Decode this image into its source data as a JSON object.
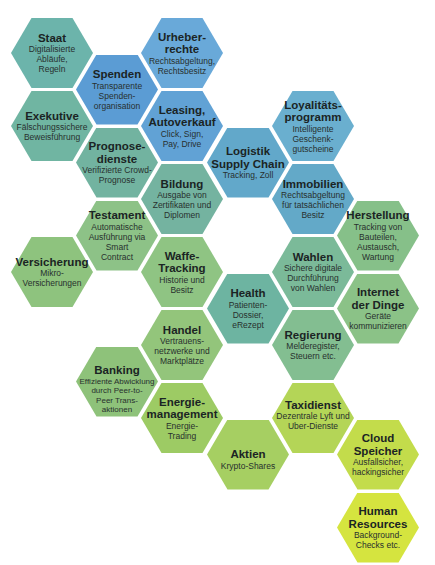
{
  "hexes": [
    {
      "title": "Staat",
      "description": "Digitalisierte\nAbläufe,\nRegeln",
      "color": "#6cb4ab"
    },
    {
      "title": "Exekutive",
      "description": "Fälschungssichere\nBeweisführung",
      "color": "#70b5a2"
    },
    {
      "title": "Versicherung",
      "description": "Mikro-\nVersicherungen",
      "color": "#8ec37e"
    },
    {
      "title": "Spenden",
      "description": "Transparente\nSpenden-\norganisation",
      "color": "#5b9cd4"
    },
    {
      "title": "Prognose-\ndienste",
      "description": "Verifizierte Crowd-\nPrognose",
      "color": "#72b3a0"
    },
    {
      "title": "Testament",
      "description": "Automatische\nAusführung via\nSmart\nContract",
      "color": "#8dc287"
    },
    {
      "title": "Banking",
      "description": "Effiziente Abwicklung\ndurch Peer-to-\nPeer Trans-\naktionen",
      "color": "#8ec27a"
    },
    {
      "title": "Urheber-\nrechte",
      "description": "Rechtsabgeltung,\nRechtsbesitz",
      "color": "#69a9d9"
    },
    {
      "title": "Leasing,\nAutoverkauf",
      "description": "Click, Sign,\nPay, Drive",
      "color": "#61a2d5"
    },
    {
      "title": "Bildung",
      "description": "Ausgabe von\nZertifikaten und\nDiplomen",
      "color": "#74b3a0"
    },
    {
      "title": "Waffe-\nTracking",
      "description": "Historie und\nBesitz",
      "color": "#8fc483"
    },
    {
      "title": "Handel",
      "description": "Vertrauens-\nnetzwerke und\nMarktplätze",
      "color": "#93c57b"
    },
    {
      "title": "Energie-\nmanagement",
      "description": "Energie-\nTrading",
      "color": "#9dcb64"
    },
    {
      "title": "Logistik\nSupply Chain",
      "description": "Tracking, Zoll",
      "color": "#62a8ca"
    },
    {
      "title": "Health",
      "description": "Patienten-\nDossier,\neRezept",
      "color": "#6db4a1"
    },
    {
      "title": "Aktien",
      "description": "Krypto-Shares",
      "color": "#a6cf62"
    },
    {
      "title": "Loyalitäts-\nprogramm",
      "description": "Intelligente\nGeschenk-\ngutscheine",
      "color": "#6aafcf"
    },
    {
      "title": "Immobilien",
      "description": "Rechtsabgeltung\nfür tatsächlichen\nBesitz",
      "color": "#63a9c8"
    },
    {
      "title": "Wahlen",
      "description": "Sichere digitale\nDurchführung\nvon Wahlen",
      "color": "#7bba99"
    },
    {
      "title": "Regierung",
      "description": "Melderegister,\nSteuern etc.",
      "color": "#83be91"
    },
    {
      "title": "Taxidienst",
      "description": "Dezentrale Lyft und\nUber-Dienste",
      "color": "#b4d557"
    },
    {
      "title": "Herstellung",
      "description": "Tracking von\nBauteilen,\nAustausch,\nWartung",
      "color": "#86c089"
    },
    {
      "title": "Internet\nder Dinge",
      "description": "Geräte\nkommunizieren",
      "color": "#8bc287"
    },
    {
      "title": "Cloud\nSpeicher",
      "description": "Ausfallsicher,\nhackingsicher",
      "color": "#c3dc4b"
    },
    {
      "title": "Human\nResources",
      "description": "Background-\nChecks etc.",
      "color": "#d5e43f"
    }
  ]
}
